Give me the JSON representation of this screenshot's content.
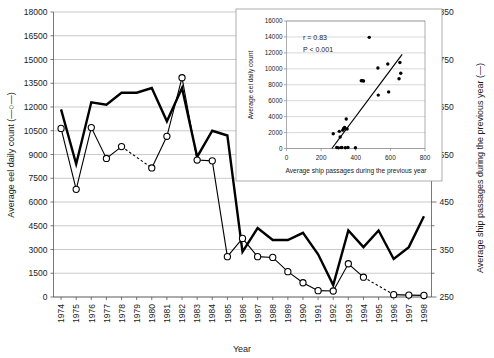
{
  "figure": {
    "title": "",
    "background": "#ffffff"
  },
  "chart_data": [
    {
      "id": "main",
      "type": "line",
      "title": "",
      "xlabel": "Year",
      "x": [
        1974,
        1975,
        1976,
        1977,
        1978,
        1979,
        1980,
        1981,
        1982,
        1983,
        1984,
        1985,
        1986,
        1987,
        1988,
        1989,
        1990,
        1991,
        1992,
        1993,
        1994,
        1995,
        1996,
        1997,
        1998
      ],
      "xticklabels": [
        "1974",
        "1975",
        "1976",
        "1977",
        "1978",
        "1979",
        "1980",
        "1981",
        "1982",
        "1983",
        "1984",
        "1985",
        "1986",
        "1987",
        "1988",
        "1989",
        "1990",
        "1991",
        "1992",
        "1993",
        "1994",
        "1995",
        "1996",
        "1997",
        "1998"
      ],
      "grid": true,
      "legend_position": "axis-labels",
      "axes": [
        {
          "id": "left",
          "label": "Average eel daily count (—○—)",
          "ylim": [
            0,
            18000
          ],
          "ytick_step": 1500,
          "yticklabels": [
            "0",
            "1500",
            "3000",
            "4500",
            "6000",
            "7500",
            "9000",
            "10500",
            "12000",
            "13500",
            "15000",
            "16500",
            "18000"
          ]
        },
        {
          "id": "right",
          "label": "Average ship passages during the previous year (—)",
          "ylim": [
            250,
            850
          ],
          "ytick_step": 100,
          "yticklabels": [
            "250",
            "350",
            "450",
            "550",
            "650",
            "750",
            "850"
          ],
          "minor_tick_step": 50
        }
      ],
      "series": [
        {
          "name": "Average eel daily count",
          "axis": "left",
          "marker": "open-circle",
          "line_style": "solid-with-dashed-gaps",
          "dashed_segments": [
            [
              1978,
              1980
            ],
            [
              1994,
              1996
            ]
          ],
          "values": [
            10650,
            6800,
            10700,
            8750,
            9500,
            null,
            8150,
            10150,
            13850,
            8650,
            8600,
            2550,
            3700,
            2550,
            2500,
            1600,
            900,
            400,
            380,
            2100,
            1250,
            null,
            150,
            120,
            100
          ]
        },
        {
          "name": "Average ship passages during the previous year",
          "axis": "right",
          "marker": "none",
          "line_style": "thick-solid",
          "values": [
            645,
            530,
            660,
            655,
            680,
            680,
            690,
            620,
            690,
            545,
            600,
            590,
            345,
            395,
            370,
            370,
            385,
            340,
            275,
            390,
            355,
            390,
            330,
            355,
            420
          ]
        }
      ]
    },
    {
      "id": "inset",
      "type": "scatter",
      "title": "",
      "xlabel": "Average ship passages during the previous year",
      "ylabel": "Average eel daily count",
      "xlim": [
        0,
        800
      ],
      "ylim": [
        0,
        16000
      ],
      "xtick_step": 200,
      "ytick_step": 2000,
      "xticklabels": [
        "0",
        "200",
        "400",
        "600",
        "800"
      ],
      "yticklabels": [
        "0",
        "2000",
        "4000",
        "6000",
        "8000",
        "10000",
        "12000",
        "14000",
        "16000"
      ],
      "grid": true,
      "annotations": [
        {
          "name": "correlation",
          "text": "r  = 0.83"
        },
        {
          "name": "p-value",
          "text": "P  < 0.001"
        }
      ],
      "points": [
        {
          "x": 270,
          "y": 1850
        },
        {
          "x": 290,
          "y": 120
        },
        {
          "x": 300,
          "y": 80
        },
        {
          "x": 305,
          "y": 2150
        },
        {
          "x": 310,
          "y": 1450
        },
        {
          "x": 315,
          "y": 110
        },
        {
          "x": 320,
          "y": 130
        },
        {
          "x": 325,
          "y": 2300
        },
        {
          "x": 330,
          "y": 2500
        },
        {
          "x": 333,
          "y": 2550
        },
        {
          "x": 336,
          "y": 2650
        },
        {
          "x": 340,
          "y": 100
        },
        {
          "x": 345,
          "y": 3700
        },
        {
          "x": 350,
          "y": 2450
        },
        {
          "x": 355,
          "y": 130
        },
        {
          "x": 398,
          "y": 90
        },
        {
          "x": 432,
          "y": 8500
        },
        {
          "x": 438,
          "y": 8520
        },
        {
          "x": 445,
          "y": 8480
        },
        {
          "x": 478,
          "y": 13950
        },
        {
          "x": 528,
          "y": 10100
        },
        {
          "x": 530,
          "y": 6700
        },
        {
          "x": 585,
          "y": 10600
        },
        {
          "x": 590,
          "y": 7100
        },
        {
          "x": 650,
          "y": 8750
        },
        {
          "x": 655,
          "y": 10800
        },
        {
          "x": 660,
          "y": 9450
        }
      ],
      "fit_line": {
        "x1": 262,
        "y1": 0,
        "x2": 668,
        "y2": 11800
      }
    }
  ]
}
